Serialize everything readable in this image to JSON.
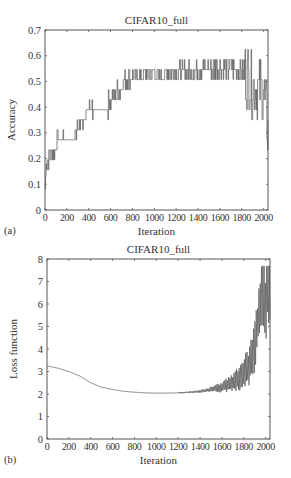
{
  "chart_data": [
    {
      "type": "line",
      "panel_label": "(a)",
      "title": "CIFAR10_full",
      "xlabel": "Iteration",
      "ylabel": "Accuracy",
      "xlim": [
        0,
        2040
      ],
      "ylim": [
        0,
        0.7
      ],
      "xticks": [
        0,
        200,
        400,
        600,
        800,
        1000,
        1200,
        1400,
        1600,
        1800,
        2000
      ],
      "yticks": [
        0,
        0.1,
        0.2,
        0.3,
        0.4,
        0.5,
        0.6,
        0.7
      ],
      "ytick_labels": [
        "0",
        "0.1",
        "0.2",
        "0.3",
        "0.4",
        "0.5",
        "0.6",
        "0.7"
      ],
      "grid": false,
      "series": [
        {
          "name": "Accuracy",
          "color": "#555555",
          "x": [
            0,
            10,
            20,
            40,
            60,
            80,
            100,
            120,
            200,
            240,
            260,
            280,
            300,
            320,
            340,
            400,
            460,
            500,
            560,
            600,
            640,
            680,
            700,
            740,
            800,
            900,
            1000,
            1100,
            1200,
            1300,
            1400,
            1500,
            1600,
            1700,
            1800,
            1840,
            1880,
            1920,
            1960,
            2000,
            2040
          ],
          "y": [
            0.08,
            0.19,
            0.2,
            0.21,
            0.21,
            0.23,
            0.25,
            0.27,
            0.27,
            0.29,
            0.28,
            0.3,
            0.31,
            0.35,
            0.35,
            0.39,
            0.39,
            0.39,
            0.4,
            0.43,
            0.45,
            0.46,
            0.49,
            0.51,
            0.52,
            0.52,
            0.53,
            0.53,
            0.54,
            0.54,
            0.54,
            0.55,
            0.55,
            0.55,
            0.55,
            0.52,
            0.5,
            0.48,
            0.47,
            0.46,
            0.32
          ]
        }
      ]
    },
    {
      "type": "line",
      "panel_label": "(b)",
      "title": "CIFAR10_full",
      "xlabel": "Iteration",
      "ylabel": "Loss function",
      "xlim": [
        0,
        2040
      ],
      "ylim": [
        0,
        8
      ],
      "xticks": [
        0,
        200,
        400,
        600,
        800,
        1000,
        1200,
        1400,
        1600,
        1800,
        2000
      ],
      "yticks": [
        0,
        1,
        2,
        3,
        4,
        5,
        6,
        7,
        8
      ],
      "ytick_labels": [
        "0",
        "1",
        "2",
        "3",
        "4",
        "5",
        "6",
        "7",
        "8"
      ],
      "grid": false,
      "series": [
        {
          "name": "Loss",
          "color": "#555555",
          "x": [
            0,
            100,
            200,
            300,
            400,
            500,
            600,
            700,
            800,
            900,
            1000,
            1100,
            1200,
            1300,
            1400,
            1500,
            1600,
            1700,
            1750,
            1800,
            1850,
            1900,
            1925,
            1950,
            1975,
            2000,
            2020,
            2040
          ],
          "y": [
            3.25,
            3.15,
            3.0,
            2.8,
            2.5,
            2.3,
            2.2,
            2.12,
            2.08,
            2.05,
            2.04,
            2.04,
            2.05,
            2.08,
            2.12,
            2.2,
            2.3,
            2.5,
            2.65,
            2.9,
            3.3,
            4.0,
            5.0,
            6.2,
            6.5,
            6.0,
            6.8,
            6.3
          ]
        }
      ]
    }
  ]
}
